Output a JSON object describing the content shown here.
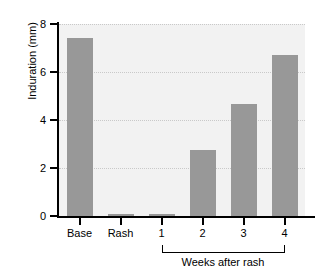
{
  "chart_data": {
    "type": "bar",
    "title": "",
    "xlabel": "",
    "ylabel": "Induration (mm)",
    "categories": [
      "Base",
      "Rash",
      "1",
      "2",
      "3",
      "4"
    ],
    "values": [
      7.4,
      0.1,
      0.1,
      2.75,
      4.65,
      6.7
    ],
    "ylim": [
      0,
      8
    ],
    "yticks": [
      0,
      2,
      4,
      6,
      8
    ],
    "ytick_labels": [
      "0",
      "2",
      "4",
      "6",
      "8"
    ],
    "grid": true,
    "grid_axis": "y",
    "legend": null,
    "annotations": [
      {
        "text": "Weeks after rash",
        "spans_categories": [
          "1",
          "2",
          "3",
          "4"
        ],
        "style": "bracket-below-axis"
      }
    ],
    "colors": {
      "bar": "#989898",
      "plot_background": "#f2f2f2",
      "figure_background": "#ffffff",
      "axis": "#000000",
      "gridline": "#c9c9c9",
      "text": "#000000"
    }
  }
}
